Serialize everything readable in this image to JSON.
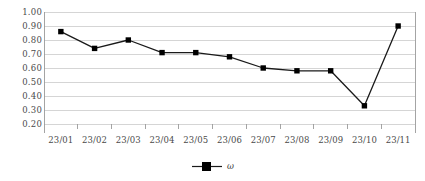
{
  "chart_data": {
    "type": "line",
    "title": "",
    "xlabel": "",
    "ylabel": "",
    "categories": [
      "23/01",
      "23/02",
      "23/03",
      "23/04",
      "23/05",
      "23/06",
      "23/07",
      "23/08",
      "23/09",
      "23/10",
      "23/11"
    ],
    "values": [
      0.86,
      0.74,
      0.8,
      0.71,
      0.71,
      0.68,
      0.6,
      0.58,
      0.58,
      0.33,
      0.9
    ],
    "series": [
      {
        "name": "ω",
        "values": [
          0.86,
          0.74,
          0.8,
          0.71,
          0.71,
          0.68,
          0.6,
          0.58,
          0.58,
          0.33,
          0.9
        ]
      }
    ],
    "ylim": [
      0.2,
      1.0
    ],
    "ytick_step": 0.1,
    "ytick_labels": [
      "1.00",
      "0.90",
      "0.80",
      "0.70",
      "0.60",
      "0.50",
      "0.40",
      "0.30",
      "0.20"
    ],
    "ytick_values": [
      1.0,
      0.9,
      0.8,
      0.7,
      0.6,
      0.5,
      0.4,
      0.3,
      0.2
    ],
    "grid": true,
    "grid_axis": "y",
    "legend": {
      "position": "bottom",
      "entries": [
        {
          "label": "ω",
          "marker": "square",
          "color": "#000000"
        }
      ]
    },
    "colors": {
      "line": "#1a1a1a",
      "marker": "#000000",
      "grid": "#d0d0d0",
      "axis": "#9a9a9a",
      "tick_text": "#4a4a4a",
      "background": "#ffffff"
    }
  }
}
